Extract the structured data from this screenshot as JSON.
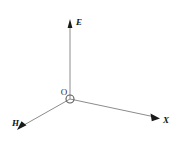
{
  "figure": {
    "background_color": "#ffffff",
    "line_color": "#8c8c8c",
    "arrow_color": "#1a1a1a",
    "label_color": "#141414",
    "width": 176,
    "height": 141
  },
  "origin": {
    "label": "O",
    "x": 70,
    "y": 99,
    "marker_radius": 4,
    "label_x": 64,
    "label_y": 95
  },
  "axes": [
    {
      "id": "e-axis",
      "label": "E",
      "direction": "up",
      "start_x": 70,
      "start_y": 99,
      "end_x": 70,
      "end_y": 24,
      "label_x": 76,
      "label_y": 25,
      "arrow_points": "70,19 67.6,28 72.4,28"
    },
    {
      "id": "x-axis",
      "label": "X",
      "direction": "down-right",
      "start_x": 70,
      "start_y": 99,
      "end_x": 155,
      "end_y": 117,
      "label_x": 163,
      "label_y": 123,
      "arrow_points": "160,118.5 150.5,113.6 151.8,121.3"
    },
    {
      "id": "h-axis",
      "label": "H",
      "direction": "down-left",
      "start_x": 70,
      "start_y": 99,
      "end_x": 24,
      "end_y": 125,
      "label_x": 12,
      "label_y": 126,
      "arrow_points": "17,130 26.5,125.2 21.5,121.3"
    }
  ]
}
